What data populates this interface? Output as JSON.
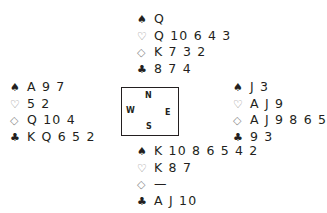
{
  "diagram": {
    "type": "bridge-deal",
    "north": {
      "spades": "Q",
      "hearts": "Q 10 6 4 3",
      "diamonds": "K 7 3 2",
      "clubs": "8 7 4"
    },
    "west": {
      "spades": "A 9 7",
      "hearts": "5 2",
      "diamonds": "Q 10 4",
      "clubs": "K Q 6 5 2"
    },
    "east": {
      "spades": "J 3",
      "hearts": "A J 9",
      "diamonds": "A J 9 8 6 5",
      "clubs": "9 3"
    },
    "south": {
      "spades": "K 10 8 6 5 4 2",
      "hearts": "K 8 7",
      "diamonds": "—",
      "clubs": "A J 10"
    },
    "compass": {
      "n": "N",
      "s": "S",
      "e": "E",
      "w": "W"
    },
    "symbols": {
      "spades": "♠",
      "hearts": "♡",
      "diamonds": "◇",
      "clubs": "♣"
    }
  }
}
